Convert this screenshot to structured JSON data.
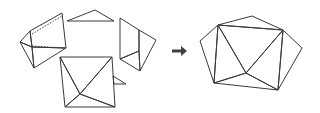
{
  "diagram": {
    "colors": {
      "background": "#ffffff",
      "edge": "#3a3a3a",
      "face_white": "#ffffff",
      "face_light": "#e4e4e4",
      "face_mid": "#c4c4c4",
      "face_dark": "#9a9a9a",
      "face_darkest": "#6e6e6e",
      "arrow": "#404040"
    },
    "arrow": {
      "symbol": "→",
      "direction": "right"
    },
    "left_group": {
      "pieces": [
        "left-folded-piece",
        "top-triangle",
        "right-folded-piece",
        "bottom-pyramid-square",
        "small-side-triangle"
      ]
    },
    "right_group": {
      "pieces": [
        "assembled-polyhedron"
      ]
    }
  }
}
